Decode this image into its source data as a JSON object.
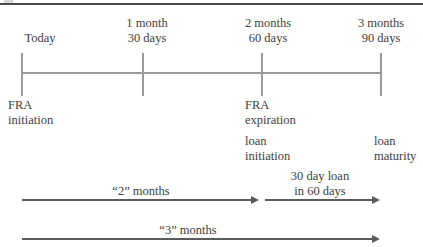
{
  "diagram": {
    "title_rule": true,
    "axis": {
      "start_x": 22,
      "end_x": 381,
      "y": 73
    },
    "ticks": [
      {
        "x": 22,
        "top_label_line1": "Today",
        "top_label_line2": "",
        "bottom_label_line1": "FRA",
        "bottom_label_line2": "initiation"
      },
      {
        "x": 143,
        "top_label_line1": "1 month",
        "top_label_line2": "30 days",
        "bottom_label_line1": "",
        "bottom_label_line2": ""
      },
      {
        "x": 262,
        "top_label_line1": "2 months",
        "top_label_line2": "60 days",
        "bottom_label_line1": "FRA",
        "bottom_label_line2": "expiration"
      },
      {
        "x": 381,
        "top_label_line1": "3 months",
        "top_label_line2": "90 days",
        "bottom_label_line1": "",
        "bottom_label_line2": ""
      }
    ],
    "secondary_labels": {
      "loan_initiation_line1": "loan",
      "loan_initiation_line2": "initiation",
      "loan_maturity_line1": "loan",
      "loan_maturity_line2": "maturity"
    },
    "arrows": [
      {
        "name": "two-months-arrow",
        "label_line1": "“2” months",
        "label_line2": "",
        "start_x": 22,
        "end_x": 260,
        "y": 199
      },
      {
        "name": "thirty-day-loan-arrow",
        "label_line1": "30 day loan",
        "label_line2": "in 60 days",
        "start_x": 265,
        "end_x": 381,
        "y": 199
      },
      {
        "name": "three-months-arrow",
        "label_line1": "“3” months",
        "label_line2": "",
        "start_x": 22,
        "end_x": 381,
        "y": 238
      }
    ],
    "colors": {
      "axis": "#9a9a9a",
      "arrow": "#5b5b5b",
      "text": "#3d3d3d",
      "rule": "#4a4a4a"
    }
  }
}
